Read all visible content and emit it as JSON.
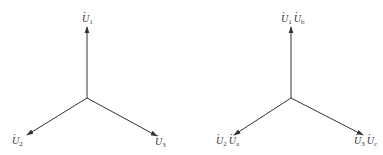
{
  "diagrams": [
    {
      "name": "phasor-diagram-left",
      "labels": {
        "top": [
          {
            "symbol": "U",
            "sub": "1"
          }
        ],
        "left": [
          {
            "symbol": "U",
            "sub": "2"
          }
        ],
        "right": [
          {
            "symbol": "U",
            "sub": "3"
          }
        ]
      },
      "center": [
        87,
        98
      ],
      "tips": {
        "top": [
          87,
          27
        ],
        "left": [
          27,
          135
        ],
        "right": [
          157,
          136
        ]
      }
    },
    {
      "name": "phasor-diagram-right",
      "labels": {
        "top": [
          {
            "symbol": "U",
            "sub": "1"
          },
          {
            "symbol": "U",
            "sub": "b"
          }
        ],
        "left": [
          {
            "symbol": "U",
            "sub": "2"
          },
          {
            "symbol": "U",
            "sub": "a"
          }
        ],
        "right": [
          {
            "symbol": "U",
            "sub": "3"
          },
          {
            "symbol": "U",
            "sub": "c"
          }
        ]
      },
      "center": [
        291,
        98
      ],
      "tips": {
        "top": [
          291,
          27
        ],
        "left": [
          234,
          135
        ],
        "right": [
          363,
          135
        ]
      }
    }
  ],
  "colors": {
    "stroke": "#333333",
    "background": "#ffffff"
  }
}
